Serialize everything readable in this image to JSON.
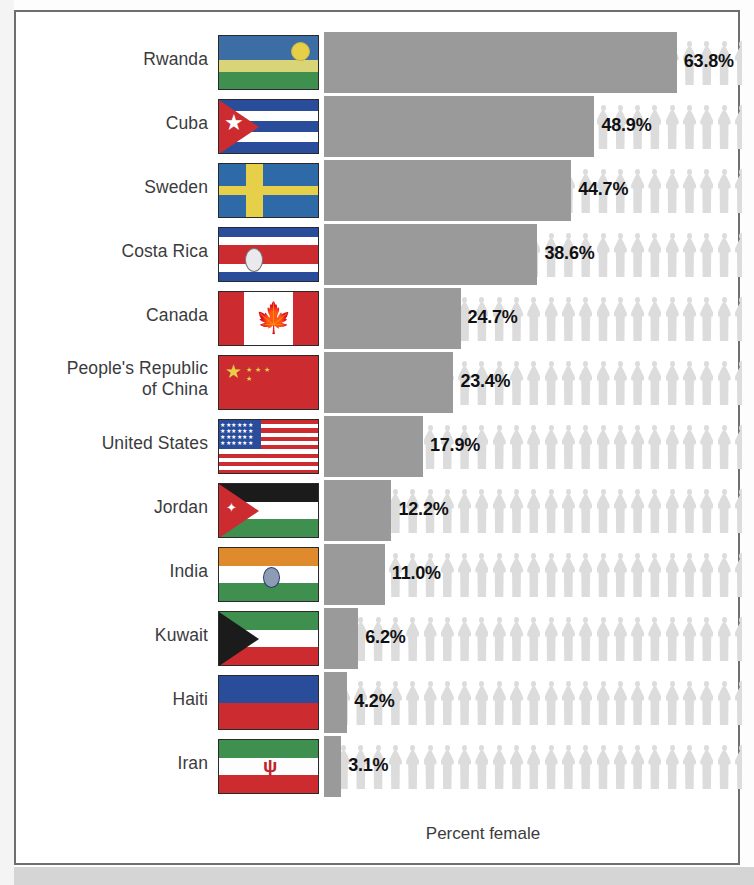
{
  "axis": {
    "label": "Percent female"
  },
  "colors": {
    "bar": "#9a9a9a",
    "person": "#dcdcdc",
    "label_text": "#3b3b3d",
    "value_text": "#111113",
    "panel_border": "#6e6e72",
    "bottom_band": "#d5d5d5"
  },
  "chart_data": {
    "type": "bar",
    "title": "",
    "subtitle": "",
    "xlabel": "Percent female",
    "ylabel": "",
    "xlim": [
      0,
      76
    ],
    "grid": false,
    "legend": false,
    "orientation": "horizontal",
    "value_suffix": "%",
    "pictogram": {
      "icon": "person-icon",
      "icon_count_per_row": 24,
      "icon_color": "#dcdcdc",
      "note": "row of faded person icons spans full plot width behind each bar"
    },
    "categories": [
      "Rwanda",
      "Cuba",
      "Sweden",
      "Costa Rica",
      "Canada",
      "People's Republic of China",
      "United States",
      "Jordan",
      "India",
      "Kuwait",
      "Haiti",
      "Iran"
    ],
    "values": [
      63.8,
      48.9,
      44.7,
      38.6,
      24.7,
      23.4,
      17.9,
      12.2,
      11.0,
      6.2,
      4.2,
      3.1
    ],
    "value_labels": [
      "63.8%",
      "48.9%",
      "44.7%",
      "38.6%",
      "24.7%",
      "23.4%",
      "17.9%",
      "12.2%",
      "11.0%",
      "6.2%",
      "4.2%",
      "3.1%"
    ]
  },
  "rows": [
    {
      "country": "Rwanda",
      "label_lines": [
        "Rwanda"
      ],
      "value": 63.8,
      "value_label": "63.8%",
      "flag_name": "flag-rwanda"
    },
    {
      "country": "Cuba",
      "label_lines": [
        "Cuba"
      ],
      "value": 48.9,
      "value_label": "48.9%",
      "flag_name": "flag-cuba"
    },
    {
      "country": "Sweden",
      "label_lines": [
        "Sweden"
      ],
      "value": 44.7,
      "value_label": "44.7%",
      "flag_name": "flag-sweden"
    },
    {
      "country": "Costa Rica",
      "label_lines": [
        "Costa Rica"
      ],
      "value": 38.6,
      "value_label": "38.6%",
      "flag_name": "flag-costa-rica"
    },
    {
      "country": "Canada",
      "label_lines": [
        "Canada"
      ],
      "value": 24.7,
      "value_label": "24.7%",
      "flag_name": "flag-canada"
    },
    {
      "country": "People's Republic of China",
      "label_lines": [
        "People's Republic",
        "of China"
      ],
      "value": 23.4,
      "value_label": "23.4%",
      "flag_name": "flag-china"
    },
    {
      "country": "United States",
      "label_lines": [
        "United States"
      ],
      "value": 17.9,
      "value_label": "17.9%",
      "flag_name": "flag-united-states"
    },
    {
      "country": "Jordan",
      "label_lines": [
        "Jordan"
      ],
      "value": 12.2,
      "value_label": "12.2%",
      "flag_name": "flag-jordan"
    },
    {
      "country": "India",
      "label_lines": [
        "India"
      ],
      "value": 11.0,
      "value_label": "11.0%",
      "flag_name": "flag-india"
    },
    {
      "country": "Kuwait",
      "label_lines": [
        "Kuwait"
      ],
      "value": 6.2,
      "value_label": "6.2%",
      "flag_name": "flag-kuwait"
    },
    {
      "country": "Haiti",
      "label_lines": [
        "Haiti"
      ],
      "value": 4.2,
      "value_label": "4.2%",
      "flag_name": "flag-haiti"
    },
    {
      "country": "Iran",
      "label_lines": [
        "Iran"
      ],
      "value": 3.1,
      "value_label": "3.1%",
      "flag_name": "flag-iran"
    }
  ]
}
